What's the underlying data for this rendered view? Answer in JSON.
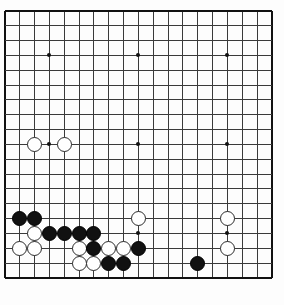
{
  "app": {
    "title": "Go Board",
    "board_name": "goban",
    "board_size": 19,
    "grid": {
      "origin_x": 5,
      "origin_y": 11,
      "spacing": 14.83,
      "line_color": "#3a3a3a",
      "edge_color": "#111111",
      "background": "#fdfdfd"
    }
  },
  "chart_data": {
    "type": "table",
    "xlabel": "column",
    "ylabel": "row",
    "columns": 19,
    "rows": 19,
    "star_points": [
      {
        "col": 4,
        "row": 4
      },
      {
        "col": 10,
        "row": 4
      },
      {
        "col": 16,
        "row": 4
      },
      {
        "col": 4,
        "row": 10
      },
      {
        "col": 10,
        "row": 10
      },
      {
        "col": 16,
        "row": 10
      },
      {
        "col": 4,
        "row": 16
      },
      {
        "col": 10,
        "row": 16
      },
      {
        "col": 16,
        "row": 16
      }
    ],
    "stones": [
      {
        "color": "white",
        "col": 3,
        "row": 10
      },
      {
        "color": "white",
        "col": 5,
        "row": 10
      },
      {
        "color": "black",
        "col": 2,
        "row": 15
      },
      {
        "color": "black",
        "col": 3,
        "row": 15
      },
      {
        "color": "white",
        "col": 10,
        "row": 15
      },
      {
        "color": "white",
        "col": 16,
        "row": 15
      },
      {
        "color": "white",
        "col": 3,
        "row": 16
      },
      {
        "color": "black",
        "col": 4,
        "row": 16
      },
      {
        "color": "black",
        "col": 5,
        "row": 16
      },
      {
        "color": "black",
        "col": 6,
        "row": 16
      },
      {
        "color": "black",
        "col": 7,
        "row": 16
      },
      {
        "color": "white",
        "col": 2,
        "row": 17
      },
      {
        "color": "white",
        "col": 3,
        "row": 17
      },
      {
        "color": "white",
        "col": 6,
        "row": 17
      },
      {
        "color": "black",
        "col": 7,
        "row": 17
      },
      {
        "color": "white",
        "col": 8,
        "row": 17
      },
      {
        "color": "white",
        "col": 9,
        "row": 17
      },
      {
        "color": "black",
        "col": 10,
        "row": 17
      },
      {
        "color": "white",
        "col": 16,
        "row": 17
      },
      {
        "color": "white",
        "col": 6,
        "row": 18
      },
      {
        "color": "white",
        "col": 7,
        "row": 18
      },
      {
        "color": "black",
        "col": 8,
        "row": 18
      },
      {
        "color": "black",
        "col": 9,
        "row": 18
      },
      {
        "color": "black",
        "col": 14,
        "row": 18
      }
    ],
    "legend": [
      {
        "name": "black-stone",
        "color": "#111111"
      },
      {
        "name": "white-stone",
        "color": "#ffffff"
      }
    ],
    "grid_on": true,
    "legend_position": "none"
  }
}
